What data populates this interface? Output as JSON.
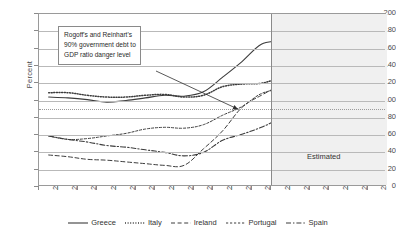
{
  "chart_data": {
    "type": "line",
    "title": "",
    "xlabel": "",
    "ylabel": "Percent",
    "ylim": [
      0,
      200
    ],
    "ytick_step": 20,
    "yticks": [
      0,
      20,
      40,
      60,
      80,
      100,
      120,
      140,
      160,
      180,
      200
    ],
    "grid": true,
    "legend_position": "bottom",
    "x": [
      2000,
      2001,
      2002,
      2003,
      2004,
      2005,
      2006,
      2007,
      2008,
      2009,
      2010,
      2011,
      2012,
      2013,
      2014,
      2015,
      2016,
      2017
    ],
    "categories": [
      "2000",
      "2001",
      "2002",
      "2003",
      "2004",
      "2005",
      "2006",
      "2007",
      "2008",
      "2009",
      "2010",
      "2011",
      "2012",
      "2013",
      "2014",
      "2015",
      "2016",
      "2017"
    ],
    "series": [
      {
        "name": "Greece",
        "style": "solid",
        "values": [
          104,
          103,
          101,
          98,
          100,
          103,
          106,
          105,
          110,
          127,
          145,
          165,
          170,
          181,
          180,
          175,
          165,
          152
        ]
      },
      {
        "name": "Italy",
        "style": "dotted",
        "values": [
          109,
          109,
          106,
          104,
          104,
          106,
          107,
          104,
          106,
          116,
          119,
          120,
          126,
          130,
          131,
          130,
          127,
          123
        ]
      },
      {
        "name": "Ireland",
        "style": "dashed",
        "values": [
          37,
          35,
          32,
          31,
          29,
          27,
          25,
          25,
          44,
          65,
          92,
          106,
          117,
          122,
          121,
          118,
          114,
          110
        ]
      },
      {
        "name": "Portugal",
        "style": "small-dash",
        "values": [
          59,
          55,
          56,
          59,
          62,
          67,
          69,
          68,
          72,
          83,
          93,
          108,
          113,
          116,
          115,
          113,
          110,
          107
        ]
      },
      {
        "name": "Spain",
        "style": "dash-dot",
        "values": [
          59,
          55,
          52,
          48,
          46,
          43,
          40,
          36,
          40,
          54,
          61,
          69,
          79,
          86,
          90,
          92,
          93,
          93
        ]
      }
    ],
    "annotations": [
      {
        "name": "danger-level-callout",
        "text_lines": [
          "Rogoff's and Reinhart's",
          "90% government debt to",
          "GDP ratio danger level"
        ],
        "points_to_value": 90
      },
      {
        "name": "estimated-region",
        "label": "Estimated",
        "start_x": 2011.5,
        "end_x": 2017.5
      }
    ],
    "reference_lines": [
      {
        "name": "90-percent-danger-level",
        "value": 90,
        "style": "dotted"
      }
    ]
  },
  "legend": {
    "items": [
      {
        "label": "Greece",
        "style": "solid"
      },
      {
        "label": "Italy",
        "style": "dotted"
      },
      {
        "label": "Ireland",
        "style": "dashed"
      },
      {
        "label": "Portugal",
        "style": "small-dash"
      },
      {
        "label": "Spain",
        "style": "dash-dot"
      }
    ]
  },
  "axis": {
    "y_title": "Percent"
  }
}
